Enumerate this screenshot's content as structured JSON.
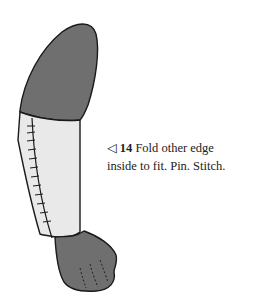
{
  "figure": {
    "step_marker": "◁",
    "step_number": "14",
    "instruction_line1": "Fold other edge",
    "instruction_line2": "inside to fit. Pin. Stitch.",
    "colors": {
      "fur": "#6f6f6f",
      "fabric_sleeve": "#e9e9e9",
      "outline": "#1a1a1a"
    }
  }
}
